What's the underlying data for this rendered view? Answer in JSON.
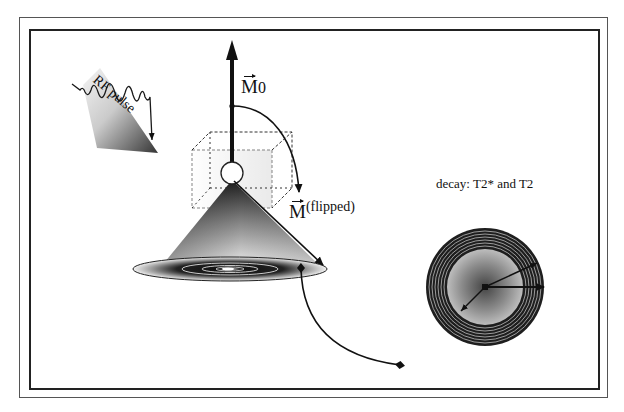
{
  "diagram": {
    "labels": {
      "rf_pulse": "RF pulse",
      "m0_symbol": "M",
      "m0_subscript": "0",
      "m_flipped_symbol": "M",
      "m_flipped_sup": "(flipped)",
      "decay": "decay: T2* and T2"
    },
    "elements": [
      {
        "id": "rf-pulse-wave",
        "type": "shaded-triangle-with-wave-arrow"
      },
      {
        "id": "m0-vector",
        "type": "vertical-arrow"
      },
      {
        "id": "flip-arc",
        "type": "curved-arrow",
        "from": "M0",
        "to": "M(flipped)"
      },
      {
        "id": "dashed-cube",
        "type": "dashed-box"
      },
      {
        "id": "spin-sphere",
        "type": "circle"
      },
      {
        "id": "precession-cone",
        "type": "shaded-cone"
      },
      {
        "id": "precession-disk",
        "type": "concentric-ellipses"
      },
      {
        "id": "connector-curve",
        "type": "curve-with-diamond-ends"
      },
      {
        "id": "decay-rings",
        "type": "concentric-circles-with-arrows"
      }
    ],
    "colors": {
      "line": "#111111",
      "frame": "#333333",
      "background": "#ffffff"
    }
  }
}
